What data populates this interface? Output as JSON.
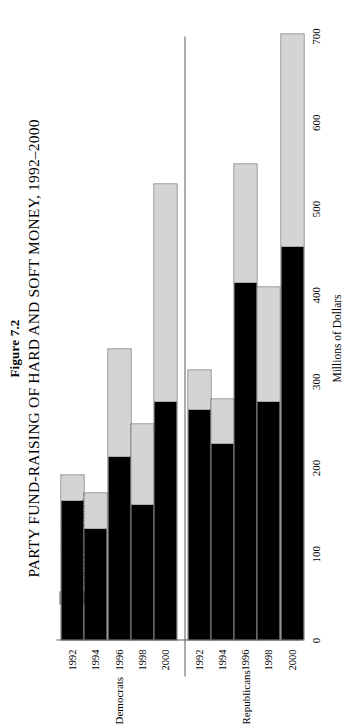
{
  "figure": {
    "number": "Figure 7.2",
    "title": "PARTY FUND-RAISING OF HARD AND SOFT MONEY, 1992–2000"
  },
  "legend": {
    "items": [
      {
        "label": "Soft (Nonfederal) Money",
        "swatch": "soft",
        "color": "#d4d4d4"
      },
      {
        "label": "Hard (Federal) Money",
        "swatch": "hard",
        "color": "#000000"
      }
    ]
  },
  "axis": {
    "value_caption": "Millions of Dollars",
    "ticks": [
      "0",
      "100",
      "200",
      "300",
      "400",
      "500",
      "600",
      "700"
    ]
  },
  "groups": [
    {
      "name": "Democrats"
    },
    {
      "name": "Republicans"
    }
  ],
  "chart_data": {
    "type": "bar",
    "orientation": "horizontal-stacked",
    "title": "PARTY FUND-RAISING OF HARD AND SOFT MONEY, 1992–2000",
    "subtitle": "Figure 7.2",
    "xlabel": "Millions of Dollars",
    "ylabel": "",
    "xlim": [
      0,
      700
    ],
    "xticks": [
      0,
      100,
      200,
      300,
      400,
      500,
      600,
      700
    ],
    "grid": false,
    "legend_position": "left",
    "stack_order": [
      "Hard (Federal) Money",
      "Soft (Nonfederal) Money"
    ],
    "series": [
      {
        "name": "Hard (Federal) Money",
        "color": "#000000"
      },
      {
        "name": "Soft (Nonfederal) Money",
        "color": "#d4d4d4"
      }
    ],
    "groups": [
      {
        "name": "Democrats",
        "categories": [
          "1992",
          "1994",
          "1996",
          "1998",
          "2000"
        ],
        "bars": [
          {
            "year": "1992",
            "hard": 163,
            "soft": 29,
            "total": 192
          },
          {
            "year": "1994",
            "hard": 130,
            "soft": 41,
            "total": 171
          },
          {
            "year": "1996",
            "hard": 213,
            "soft": 125,
            "total": 338
          },
          {
            "year": "1998",
            "hard": 158,
            "soft": 93,
            "total": 251
          },
          {
            "year": "2000",
            "hard": 277,
            "soft": 253,
            "total": 530
          }
        ]
      },
      {
        "name": "Republicans",
        "categories": [
          "1992",
          "1994",
          "1996",
          "1998",
          "2000"
        ],
        "bars": [
          {
            "year": "1992",
            "hard": 268,
            "soft": 46,
            "total": 314
          },
          {
            "year": "1994",
            "hard": 229,
            "soft": 51,
            "total": 280
          },
          {
            "year": "1996",
            "hard": 416,
            "soft": 137,
            "total": 553
          },
          {
            "year": "1998",
            "hard": 277,
            "soft": 133,
            "total": 410
          },
          {
            "year": "2000",
            "hard": 457,
            "soft": 247,
            "total": 704
          }
        ]
      }
    ]
  }
}
